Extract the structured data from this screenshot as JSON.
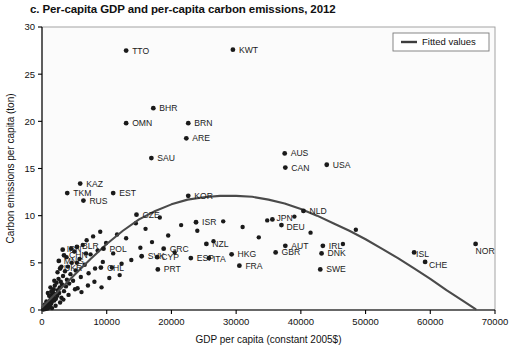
{
  "figure": {
    "panel_label": "c.",
    "title": "c. Per-capita GDP and per-capita carbon emissions, 2012"
  },
  "legend": {
    "position": "top-right",
    "entries": [
      {
        "label": "Fitted values",
        "marker": "line",
        "color": "#3d3d3d"
      }
    ]
  },
  "colors": {
    "point": "#1a1a1a",
    "curve": "#4a4a4a",
    "axis": "#000000",
    "frame": "#9a9a9a",
    "background": "#ffffff"
  },
  "chart_data": {
    "type": "scatter",
    "title": "c. Per-capita GDP and per-capita carbon emissions, 2012",
    "xlabel": "GDP per capita (constant 2005$)",
    "ylabel": "Carbon emissions per capita (ton)",
    "xlim": [
      0,
      70000
    ],
    "ylim": [
      0,
      30
    ],
    "xticks": [
      0,
      10000,
      20000,
      30000,
      40000,
      50000,
      60000,
      70000
    ],
    "yticks": [
      0,
      5,
      10,
      15,
      20,
      25,
      30
    ],
    "xtick_labels": [
      "0",
      "10000",
      "20000",
      "30000",
      "40000",
      "50000",
      "60000",
      "70000"
    ],
    "ytick_labels": [
      "0",
      "5",
      "10",
      "15",
      "20",
      "25",
      "30"
    ],
    "grid": false,
    "legend_position": "top-right",
    "labeled_points": [
      {
        "label": "TTO",
        "x": 13000,
        "y": 27.5,
        "lx": 6,
        "ly": 3
      },
      {
        "label": "KWT",
        "x": 29500,
        "y": 27.6,
        "lx": 6,
        "ly": 3
      },
      {
        "label": "BHR",
        "x": 17200,
        "y": 21.4,
        "lx": 6,
        "ly": 3
      },
      {
        "label": "OMN",
        "x": 13000,
        "y": 19.8,
        "lx": 6,
        "ly": 3
      },
      {
        "label": "BRN",
        "x": 22600,
        "y": 19.8,
        "lx": 6,
        "ly": 3
      },
      {
        "label": "ARE",
        "x": 22300,
        "y": 18.2,
        "lx": 6,
        "ly": 3
      },
      {
        "label": "SAU",
        "x": 16900,
        "y": 16.1,
        "lx": 6,
        "ly": 3
      },
      {
        "label": "AUS",
        "x": 37500,
        "y": 16.6,
        "lx": 6,
        "ly": 3
      },
      {
        "label": "CAN",
        "x": 37600,
        "y": 15.1,
        "lx": 6,
        "ly": 3
      },
      {
        "label": "USA",
        "x": 44000,
        "y": 15.4,
        "lx": 6,
        "ly": 3
      },
      {
        "label": "KAZ",
        "x": 5900,
        "y": 13.4,
        "lx": 6,
        "ly": 3
      },
      {
        "label": "TKM",
        "x": 3900,
        "y": 12.4,
        "lx": 6,
        "ly": 3
      },
      {
        "label": "RUS",
        "x": 6400,
        "y": 11.6,
        "lx": 6,
        "ly": 3
      },
      {
        "label": "EST",
        "x": 11000,
        "y": 12.4,
        "lx": 6,
        "ly": 3
      },
      {
        "label": "KOR",
        "x": 22600,
        "y": 12.1,
        "lx": 6,
        "ly": 3
      },
      {
        "label": "NLD",
        "x": 40400,
        "y": 10.5,
        "lx": 6,
        "ly": 3
      },
      {
        "label": "CZE",
        "x": 14600,
        "y": 10.1,
        "lx": 6,
        "ly": 3
      },
      {
        "label": "ISR",
        "x": 23800,
        "y": 9.3,
        "lx": 6,
        "ly": 3
      },
      {
        "label": "JPN",
        "x": 35600,
        "y": 9.6,
        "lx": 4,
        "ly": 2
      },
      {
        "label": "DEU",
        "x": 37000,
        "y": 9.0,
        "lx": 5,
        "ly": 5
      },
      {
        "label": "BLR",
        "x": 5400,
        "y": 6.7,
        "lx": 5,
        "ly": 2
      },
      {
        "label": "POL",
        "x": 9500,
        "y": 6.5,
        "lx": 6,
        "ly": 3
      },
      {
        "label": "GRC",
        "x": 18800,
        "y": 6.5,
        "lx": 6,
        "ly": 3
      },
      {
        "label": "AUT",
        "x": 37600,
        "y": 6.8,
        "lx": 6,
        "ly": 3
      },
      {
        "label": "IRL",
        "x": 43400,
        "y": 6.8,
        "lx": 6,
        "ly": 3
      },
      {
        "label": "NZL",
        "x": 25400,
        "y": 7.0,
        "lx": 6,
        "ly": 3
      },
      {
        "label": "SVK",
        "x": 15400,
        "y": 5.7,
        "lx": 6,
        "ly": 3
      },
      {
        "label": "CYP",
        "x": 17800,
        "y": 5.6,
        "lx": 4,
        "ly": 3
      },
      {
        "label": "ESP",
        "x": 23000,
        "y": 5.5,
        "lx": 6,
        "ly": 3
      },
      {
        "label": "ITA",
        "x": 25800,
        "y": 5.5,
        "lx": 4,
        "ly": 4
      },
      {
        "label": "HKG",
        "x": 29300,
        "y": 5.9,
        "lx": 6,
        "ly": 3
      },
      {
        "label": "GBR",
        "x": 36100,
        "y": 6.1,
        "lx": 6,
        "ly": 3
      },
      {
        "label": "DNK",
        "x": 43200,
        "y": 6.0,
        "lx": 6,
        "ly": 3
      },
      {
        "label": "FRA",
        "x": 30500,
        "y": 4.7,
        "lx": 6,
        "ly": 3
      },
      {
        "label": "MNG",
        "x": 2600,
        "y": 5.2,
        "lx": 5,
        "ly": 3
      },
      {
        "label": "CHN",
        "x": 3400,
        "y": 5.8,
        "lx": 5,
        "ly": 3
      },
      {
        "label": "IRN",
        "x": 3200,
        "y": 6.4,
        "lx": 4,
        "ly": 2
      },
      {
        "label": "UKR",
        "x": 2800,
        "y": 4.4,
        "lx": 4,
        "ly": 3
      },
      {
        "label": "CHL",
        "x": 9100,
        "y": 4.5,
        "lx": 6,
        "ly": 3
      },
      {
        "label": "PRT",
        "x": 17900,
        "y": 4.3,
        "lx": 6,
        "ly": 3
      },
      {
        "label": "SWE",
        "x": 43000,
        "y": 4.3,
        "lx": 6,
        "ly": 3
      },
      {
        "label": "ISL",
        "x": 57500,
        "y": 6.1,
        "lx": 2,
        "ly": 5
      },
      {
        "label": "CHE",
        "x": 59200,
        "y": 5.1,
        "lx": 4,
        "ly": 6
      },
      {
        "label": "NOR",
        "x": 67000,
        "y": 7.0,
        "lx": 0,
        "ly": 10
      }
    ],
    "unlabeled_points": [
      {
        "x": 300,
        "y": 0.1
      },
      {
        "x": 420,
        "y": 0.2
      },
      {
        "x": 520,
        "y": 0.1
      },
      {
        "x": 610,
        "y": 0.3
      },
      {
        "x": 700,
        "y": 0.2
      },
      {
        "x": 760,
        "y": 0.4
      },
      {
        "x": 830,
        "y": 0.15
      },
      {
        "x": 880,
        "y": 0.5
      },
      {
        "x": 940,
        "y": 0.3
      },
      {
        "x": 1000,
        "y": 0.6
      },
      {
        "x": 1050,
        "y": 0.25
      },
      {
        "x": 1120,
        "y": 0.8
      },
      {
        "x": 1180,
        "y": 0.4
      },
      {
        "x": 1240,
        "y": 1.0
      },
      {
        "x": 1300,
        "y": 0.55
      },
      {
        "x": 1360,
        "y": 1.3
      },
      {
        "x": 1420,
        "y": 0.7
      },
      {
        "x": 1480,
        "y": 1.6
      },
      {
        "x": 1540,
        "y": 0.9
      },
      {
        "x": 1600,
        "y": 1.1
      },
      {
        "x": 1680,
        "y": 1.9
      },
      {
        "x": 1750,
        "y": 1.4
      },
      {
        "x": 1820,
        "y": 2.2
      },
      {
        "x": 1900,
        "y": 1.0
      },
      {
        "x": 1980,
        "y": 2.6
      },
      {
        "x": 2050,
        "y": 1.7
      },
      {
        "x": 2150,
        "y": 1.2
      },
      {
        "x": 2250,
        "y": 2.9
      },
      {
        "x": 2350,
        "y": 1.5
      },
      {
        "x": 2450,
        "y": 2.1
      },
      {
        "x": 2550,
        "y": 3.3
      },
      {
        "x": 2650,
        "y": 1.8
      },
      {
        "x": 2750,
        "y": 2.4
      },
      {
        "x": 2900,
        "y": 3.0
      },
      {
        "x": 3000,
        "y": 1.3
      },
      {
        "x": 3100,
        "y": 2.7
      },
      {
        "x": 3250,
        "y": 3.6
      },
      {
        "x": 3400,
        "y": 2.0
      },
      {
        "x": 3550,
        "y": 4.1
      },
      {
        "x": 3700,
        "y": 2.5
      },
      {
        "x": 3850,
        "y": 3.2
      },
      {
        "x": 4000,
        "y": 4.6
      },
      {
        "x": 4200,
        "y": 2.8
      },
      {
        "x": 4400,
        "y": 3.8
      },
      {
        "x": 4600,
        "y": 5.0
      },
      {
        "x": 4800,
        "y": 3.1
      },
      {
        "x": 5000,
        "y": 6.2
      },
      {
        "x": 5200,
        "y": 4.2
      },
      {
        "x": 5500,
        "y": 2.3
      },
      {
        "x": 5800,
        "y": 5.4
      },
      {
        "x": 6000,
        "y": 3.5
      },
      {
        "x": 6300,
        "y": 6.9
      },
      {
        "x": 6600,
        "y": 4.8
      },
      {
        "x": 6900,
        "y": 7.4
      },
      {
        "x": 7200,
        "y": 3.9
      },
      {
        "x": 7500,
        "y": 5.9
      },
      {
        "x": 7900,
        "y": 7.8
      },
      {
        "x": 8200,
        "y": 4.4
      },
      {
        "x": 8600,
        "y": 6.3
      },
      {
        "x": 9000,
        "y": 8.3
      },
      {
        "x": 9400,
        "y": 5.1
      },
      {
        "x": 9900,
        "y": 7.1
      },
      {
        "x": 10400,
        "y": 3.4
      },
      {
        "x": 11000,
        "y": 6.0
      },
      {
        "x": 11600,
        "y": 8.0
      },
      {
        "x": 12300,
        "y": 4.9
      },
      {
        "x": 13000,
        "y": 7.6
      },
      {
        "x": 13800,
        "y": 5.3
      },
      {
        "x": 14500,
        "y": 9.2
      },
      {
        "x": 15200,
        "y": 6.6
      },
      {
        "x": 16000,
        "y": 8.6
      },
      {
        "x": 17000,
        "y": 7.2
      },
      {
        "x": 18200,
        "y": 9.8
      },
      {
        "x": 19500,
        "y": 7.9
      },
      {
        "x": 20500,
        "y": 6.1
      },
      {
        "x": 21500,
        "y": 9.0
      },
      {
        "x": 24000,
        "y": 8.4
      },
      {
        "x": 26500,
        "y": 7.3
      },
      {
        "x": 28000,
        "y": 9.4
      },
      {
        "x": 31000,
        "y": 8.8
      },
      {
        "x": 33500,
        "y": 7.7
      },
      {
        "x": 34800,
        "y": 9.5
      },
      {
        "x": 39000,
        "y": 9.9
      },
      {
        "x": 41500,
        "y": 8.2
      },
      {
        "x": 46500,
        "y": 7.0
      },
      {
        "x": 48500,
        "y": 8.5
      },
      {
        "x": 900,
        "y": 1.8
      },
      {
        "x": 1550,
        "y": 0.2
      },
      {
        "x": 2100,
        "y": 0.45
      },
      {
        "x": 2800,
        "y": 0.8
      },
      {
        "x": 3300,
        "y": 1.1
      },
      {
        "x": 4100,
        "y": 1.6
      },
      {
        "x": 5100,
        "y": 2.2
      },
      {
        "x": 6100,
        "y": 1.9
      },
      {
        "x": 7100,
        "y": 2.6
      },
      {
        "x": 8100,
        "y": 3.0
      },
      {
        "x": 9200,
        "y": 2.4
      },
      {
        "x": 10800,
        "y": 4.5
      },
      {
        "x": 12000,
        "y": 3.7
      },
      {
        "x": 1300,
        "y": 2.4
      },
      {
        "x": 1900,
        "y": 3.1
      },
      {
        "x": 2400,
        "y": 4.0
      },
      {
        "x": 3000,
        "y": 4.6
      },
      {
        "x": 3800,
        "y": 5.6
      },
      {
        "x": 4500,
        "y": 6.5
      },
      {
        "x": 5400,
        "y": 5.0
      },
      {
        "x": 6800,
        "y": 6.0
      },
      {
        "x": 200,
        "y": 0.05
      },
      {
        "x": 450,
        "y": 0.6
      },
      {
        "x": 680,
        "y": 0.9
      },
      {
        "x": 1100,
        "y": 1.5
      },
      {
        "x": 1450,
        "y": 2.0
      }
    ],
    "fitted_curve": {
      "name": "Fitted values",
      "points": [
        {
          "x": 0,
          "y": 0.3
        },
        {
          "x": 2500,
          "y": 2.0
        },
        {
          "x": 5000,
          "y": 3.7
        },
        {
          "x": 7500,
          "y": 5.4
        },
        {
          "x": 10000,
          "y": 7.0
        },
        {
          "x": 12500,
          "y": 8.4
        },
        {
          "x": 15000,
          "y": 9.6
        },
        {
          "x": 17500,
          "y": 10.5
        },
        {
          "x": 20000,
          "y": 11.2
        },
        {
          "x": 22500,
          "y": 11.7
        },
        {
          "x": 25000,
          "y": 11.95
        },
        {
          "x": 27500,
          "y": 12.1
        },
        {
          "x": 30000,
          "y": 12.1
        },
        {
          "x": 32500,
          "y": 12.0
        },
        {
          "x": 35000,
          "y": 11.7
        },
        {
          "x": 37500,
          "y": 11.3
        },
        {
          "x": 40000,
          "y": 10.7
        },
        {
          "x": 42500,
          "y": 10.0
        },
        {
          "x": 45000,
          "y": 9.2
        },
        {
          "x": 47500,
          "y": 8.4
        },
        {
          "x": 50000,
          "y": 7.5
        },
        {
          "x": 52500,
          "y": 6.5
        },
        {
          "x": 55000,
          "y": 5.5
        },
        {
          "x": 57500,
          "y": 4.4
        },
        {
          "x": 60000,
          "y": 3.3
        },
        {
          "x": 62500,
          "y": 2.1
        },
        {
          "x": 65000,
          "y": 1.0
        },
        {
          "x": 67000,
          "y": 0.1
        }
      ]
    }
  }
}
